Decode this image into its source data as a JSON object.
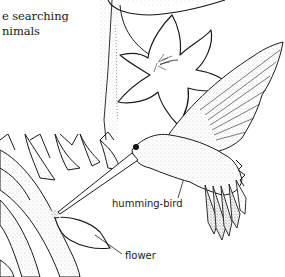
{
  "figure": {
    "body_text_lines": [
      "e searching",
      "nimals"
    ],
    "labels": [
      {
        "id": "humming-bird",
        "text": "humming-bird"
      },
      {
        "id": "flower",
        "text": "flower"
      }
    ]
  },
  "colors": {
    "ink": "#1a1a1a",
    "stipple": "#9a9a9a",
    "paper": "#ffffff"
  }
}
